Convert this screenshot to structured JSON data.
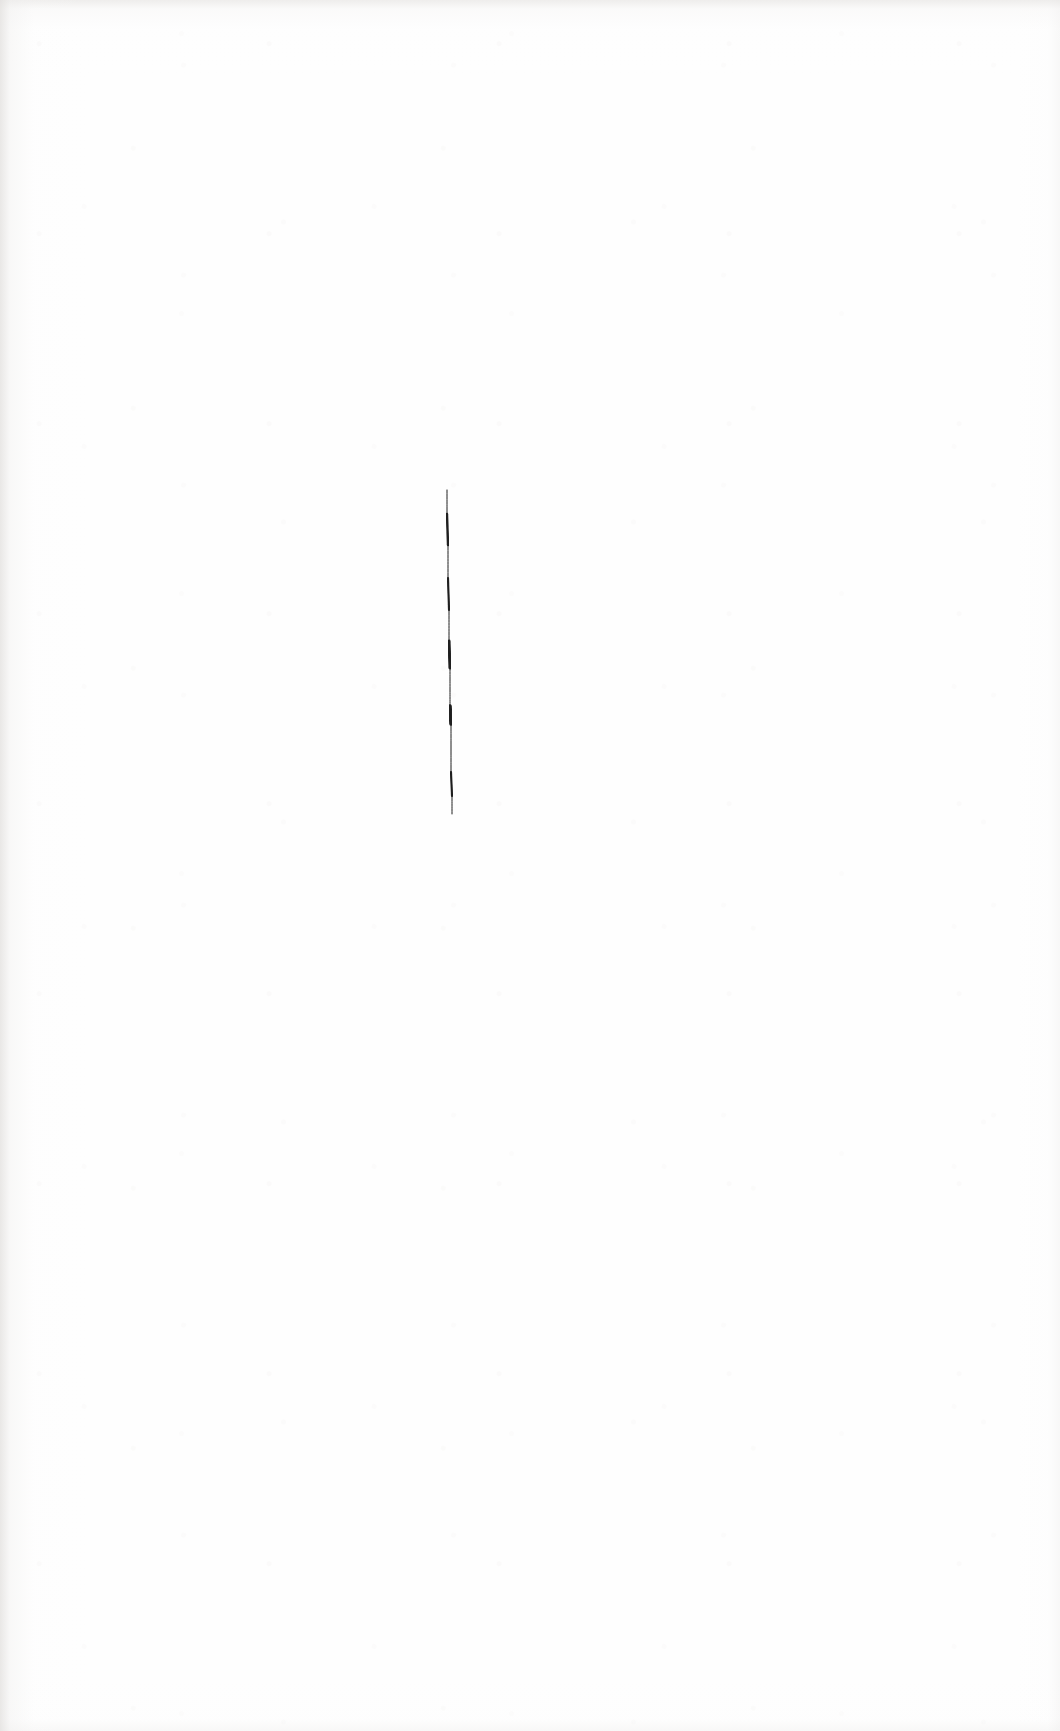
{
  "document": {
    "kind": "scanned-sheet",
    "width": 1060,
    "height": 1731,
    "paper_color": "#fefefe",
    "edge_shadow_color": "#e2e0de",
    "visible_text": "",
    "caption": ""
  },
  "ink": {
    "stroke_name": "vertical-pen-stroke",
    "color": "#1a1a1a",
    "opacity": 0.97,
    "top_x": 447,
    "top_y": 490,
    "bottom_x": 452,
    "bottom_y": 845,
    "length_px": 355,
    "min_width_px": 1.6,
    "max_width_px": 4.2,
    "has_break": true,
    "break_start_y": 814,
    "break_end_y": 819,
    "label": "single vertical hand-drawn ink line"
  },
  "chart_data": {
    "type": "line",
    "title": "",
    "subtitle": "",
    "xlabel": "",
    "ylabel": "",
    "grid": false,
    "legend": null,
    "xlim": [
      0,
      1060
    ],
    "ylim": [
      1731,
      0
    ],
    "series": [
      {
        "name": "vertical-pen-stroke",
        "color": "#1a1a1a",
        "x": [
          447,
          447,
          448,
          448,
          449,
          449,
          450,
          450,
          450,
          451,
          451,
          451,
          452,
          452,
          452
        ],
        "y": [
          490,
          514,
          545,
          578,
          610,
          641,
          668,
          690,
          706,
          724,
          748,
          772,
          796,
          814,
          845
        ],
        "widths": [
          3.4,
          2.6,
          2.2,
          2.0,
          2.2,
          2.4,
          3.8,
          3.2,
          4.2,
          3.0,
          2.4,
          2.2,
          2.0,
          1.8,
          1.6
        ]
      }
    ],
    "annotations": []
  }
}
